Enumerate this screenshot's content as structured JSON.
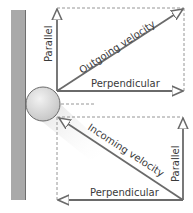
{
  "diagram": {
    "colors": {
      "wall": "#a9a9a9",
      "wall_edge": "#6e6e6e",
      "ball": "#d2d2d2",
      "arrow": "#6a6a6a",
      "dashed": "#8a8a8a",
      "text": "#3a3a3a",
      "shadow": "#e6e6e6"
    },
    "outgoing": {
      "velocity_label": "Outgoing velocity",
      "parallel_label": "Parallel",
      "perpendicular_label": "Perpendicular"
    },
    "incoming": {
      "velocity_label": "Incoming velocity",
      "parallel_label": "Parallel",
      "perpendicular_label": "Perpendicular"
    }
  }
}
